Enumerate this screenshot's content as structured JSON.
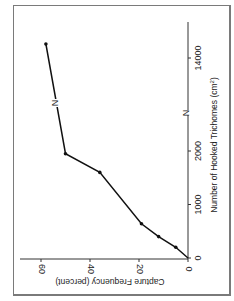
{
  "chart_data": {
    "type": "line",
    "orientation": "rotated-90-clockwise",
    "title": "",
    "xlabel": "Number of Hooked Trichomes (cm²)",
    "ylabel": "Capture Frequency (percent)",
    "x_ticks": [
      "0",
      "1000",
      "2000",
      "N",
      "14000"
    ],
    "y_ticks": [
      "0",
      "20",
      "40",
      "60"
    ],
    "x_axis_break": true,
    "break_marker": "N",
    "xlim": [
      0,
      15000
    ],
    "ylim": [
      0,
      65
    ],
    "grid": false,
    "legend": null,
    "series": [
      {
        "name": "capture frequency",
        "marker": "dot",
        "points": [
          {
            "x": 0,
            "y": 0
          },
          {
            "x": 200,
            "y": 5
          },
          {
            "x": 400,
            "y": 12
          },
          {
            "x": 640,
            "y": 19
          },
          {
            "x": 1600,
            "y": 36
          },
          {
            "x": 1950,
            "y": 50
          },
          {
            "x": 15000,
            "y": 58
          }
        ]
      }
    ]
  },
  "labels": {
    "xlabel_main": "Number of Hooked Trichomes (cm",
    "xlabel_sup": "2",
    "xlabel_end": ")",
    "ylabel": "Capture Frequency (percent)",
    "break_marker": "N"
  }
}
